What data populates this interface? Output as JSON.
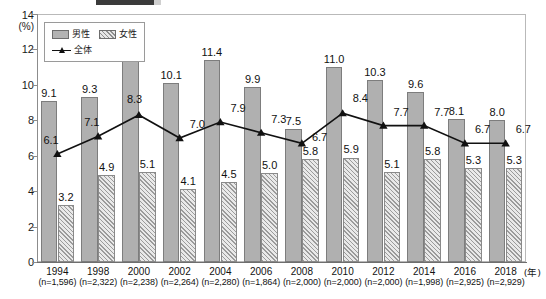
{
  "title_bar": {
    "present": true,
    "note": ""
  },
  "axis": {
    "y_top_value": "14",
    "y_unit": "(%)",
    "y_ticks": [
      "14",
      "12",
      "10",
      "8",
      "6",
      "4",
      "2",
      "0"
    ],
    "x_unit": "(年)"
  },
  "legend": {
    "male_label": "男性",
    "female_label": "女性",
    "total_label": "全体"
  },
  "colors": {
    "male_fill": "#b0b0b0",
    "male_stroke": "#7d7d7d",
    "female_fill": "#e9e9e9",
    "female_hatch": "#9b9b9b",
    "line": "#111111",
    "frame": "#b9b9b9"
  },
  "chart_data": {
    "type": "bar",
    "title": "",
    "xlabel": "(年)",
    "ylabel": "(%)",
    "ylim": [
      0,
      14
    ],
    "ytick_step": 2,
    "grid": false,
    "legend_position": "top-left-inside",
    "categories": [
      "1994",
      "1998",
      "2000",
      "2002",
      "2004",
      "2006",
      "2008",
      "2010",
      "2012",
      "2014",
      "2016",
      "2018"
    ],
    "sample_sizes": [
      "(n=1,596)",
      "(n=2,322)",
      "(n=2,238)",
      "(n=2,264)",
      "(n=2,280)",
      "(n=1,864)",
      "(n=2,000)",
      "(n=2,000)",
      "(n=2,000)",
      "(n=1,998)",
      "(n=2,925)",
      "(n=2,929)"
    ],
    "series": [
      {
        "name": "男性",
        "type": "bar",
        "values": [
          9.1,
          9.3,
          11.6,
          10.1,
          11.4,
          9.9,
          7.5,
          11.0,
          10.3,
          9.6,
          8.1,
          8.0
        ]
      },
      {
        "name": "女性",
        "type": "bar",
        "values": [
          3.2,
          4.9,
          5.1,
          4.1,
          4.5,
          5.0,
          5.8,
          5.9,
          5.1,
          5.8,
          5.3,
          5.3
        ]
      },
      {
        "name": "全体",
        "type": "line",
        "values": [
          6.1,
          7.1,
          8.3,
          7.0,
          7.9,
          7.3,
          6.7,
          8.4,
          7.7,
          7.7,
          6.7,
          6.7
        ]
      }
    ]
  }
}
